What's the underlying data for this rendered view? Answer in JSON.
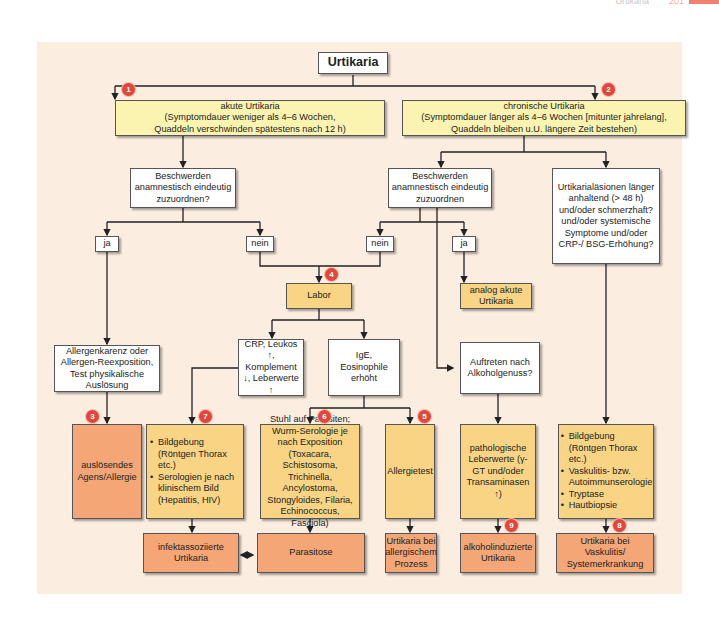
{
  "page_header": {
    "title": "Urtikaria",
    "page_number": "201"
  },
  "flowchart": {
    "root": "Urtikaria",
    "acute": "akute Urtikaria\n(Symptomdauer weniger als 4–6 Wochen,\nQuaddeln verschwinden spätestens nach 12 h)",
    "chronic": "chronische Urtikaria\n(Symptomdauer länger als 4–6 Wochen [mitunter jahrelang],\nQuaddeln bleiben u.U. längere Zeit bestehen)",
    "acute_question": "Beschwerden anamnestisch eindeutig zuzuordnen?",
    "chronic_question": "Beschwerden anamnestisch eindeutig zuzuordnen",
    "chronic_lesions_question": "Urtikarialäsionen länger anhaltend (> 48 h) und/oder schmerzhaft? und/oder systemische Symptome und/oder CRP-/ BSG-Erhöhung?",
    "ja_left": "ja",
    "nein_left": "nein",
    "nein_right": "nein",
    "ja_right": "ja",
    "labor": "Labor",
    "analog_acute": "analog akute Urtikaria",
    "allergen": "Allergenkarenz oder Allergen-Reexposition, Test physikalische Auslösung",
    "crp": "CRP, Leukos ↑, Komplement ↓, Leberwerte ↑",
    "ige": "IgE, Eosinophile erhöht",
    "alcohol_question": "Auftreten nach Alkoholgenuss?",
    "trigger": "auslösendes Agens/Allergie",
    "imaging_infect": [
      "Bildgebung (Röntgen Thorax etc.)",
      "Serologien je nach klinischem Bild (Hepatitis, HIV)"
    ],
    "stool": "Stuhl auf Parasiten; Wurm-Serologie je nach Exposition (Toxacara, Schistosoma, Trichinella, Ancylostoma, Stongyloides, Filaria, Echinococcus, Fasciola)",
    "allergy_test": "Allergietest",
    "liver": "pathologische Leberwerte (γ-GT und/oder Transaminasen ↑)",
    "vasculitis_workup": [
      "Bildgebung (Röntgen Thorax etc.)",
      "Vaskulitis- bzw. Autoimmunserologie",
      "Tryptase",
      "Hautbiopsie"
    ],
    "infect_urticaria": "infektassoziierte Urtikaria",
    "parasitosis": "Parasitose",
    "allergic_urticaria": "Urtikaria bei allergischem Prozess",
    "alcohol_urticaria": "alkoholinduzierte Urtikaria",
    "vasculitis_urticaria": "Urtikaria bei Vaskulitis/ Systemerkrankung",
    "badges": {
      "b1": "1",
      "b2": "2",
      "b3": "3",
      "b4": "4",
      "b5": "5",
      "b6": "6",
      "b7": "7",
      "b8": "8",
      "b9": "9"
    }
  },
  "colors": {
    "background": "#fbeee0",
    "white_box": "#ffffff",
    "yellow_box": "#fbf4b0",
    "orange_box": "#f8d484",
    "salmon_box": "#f4a676",
    "badge": "#e0463a"
  }
}
